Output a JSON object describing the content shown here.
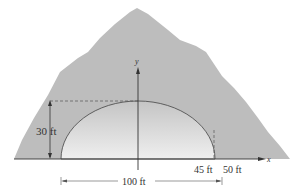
{
  "diagram": {
    "type": "semi-elliptical tunnel through mountain",
    "axes": {
      "x_label": "x",
      "y_label": "y"
    },
    "labels": {
      "height": "30 ft",
      "point_45": "45 ft",
      "point_50": "50 ft",
      "width": "100 ft"
    },
    "colors": {
      "mountain": "#bdbdbd",
      "tunnel_top": "#c9c9c9",
      "tunnel_bottom": "#ececec",
      "lines": "#333333"
    }
  }
}
